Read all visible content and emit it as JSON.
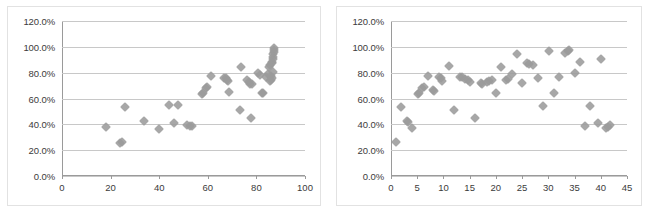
{
  "chart_data": [
    {
      "id": "left-scatter",
      "type": "scatter",
      "title": "",
      "xlabel": "",
      "ylabel": "",
      "xlim": [
        0,
        100
      ],
      "ylim": [
        0,
        1.2
      ],
      "grid": true,
      "legend": "none",
      "marker": {
        "shape": "diamond",
        "color": "#9b9b9b",
        "size": 7
      },
      "xticks": [
        0,
        20,
        40,
        60,
        80,
        100
      ],
      "xticklabels": [
        "0",
        "20",
        "40",
        "60",
        "80",
        "100"
      ],
      "yticks": [
        0,
        0.2,
        0.4,
        0.6,
        0.8,
        1.0,
        1.2
      ],
      "yticklabels": [
        "0.0%",
        "20.0%",
        "40.0%",
        "60.0%",
        "80.0%",
        "100.0%",
        "120.0%"
      ],
      "points": [
        [
          18.0,
          0.378
        ],
        [
          23.8,
          0.258
        ],
        [
          24.6,
          0.262
        ],
        [
          25.8,
          0.532
        ],
        [
          33.8,
          0.423
        ],
        [
          40.1,
          0.362
        ],
        [
          44.1,
          0.548
        ],
        [
          45.9,
          0.411
        ],
        [
          47.8,
          0.551
        ],
        [
          51.6,
          0.394
        ],
        [
          52.6,
          0.389
        ],
        [
          53.4,
          0.386
        ],
        [
          57.6,
          0.632
        ],
        [
          58.2,
          0.645
        ],
        [
          59.2,
          0.678
        ],
        [
          59.8,
          0.688
        ],
        [
          61.5,
          0.771
        ],
        [
          66.8,
          0.757
        ],
        [
          67.4,
          0.762
        ],
        [
          67.9,
          0.742
        ],
        [
          68.4,
          0.737
        ],
        [
          68.9,
          0.654
        ],
        [
          73.7,
          0.847
        ],
        [
          73.3,
          0.508
        ],
        [
          76.3,
          0.742
        ],
        [
          76.9,
          0.731
        ],
        [
          77.4,
          0.716
        ],
        [
          77.6,
          0.448
        ],
        [
          78.0,
          0.713
        ],
        [
          80.6,
          0.797
        ],
        [
          81.4,
          0.783
        ],
        [
          82.1,
          0.643
        ],
        [
          82.6,
          0.641
        ],
        [
          84.0,
          0.767
        ],
        [
          84.6,
          0.788
        ],
        [
          85.0,
          0.844
        ],
        [
          85.4,
          0.856
        ],
        [
          85.6,
          0.739
        ],
        [
          85.9,
          0.746
        ],
        [
          86.1,
          0.776
        ],
        [
          86.3,
          0.871
        ],
        [
          86.5,
          0.886
        ],
        [
          86.7,
          0.905
        ],
        [
          86.9,
          0.922
        ],
        [
          87.0,
          0.943
        ],
        [
          87.2,
          0.962
        ],
        [
          87.3,
          0.978
        ],
        [
          87.4,
          0.988
        ],
        [
          87.0,
          0.802
        ],
        [
          86.6,
          0.756
        ]
      ]
    },
    {
      "id": "right-scatter",
      "type": "scatter",
      "title": "",
      "xlabel": "",
      "ylabel": "",
      "xlim": [
        0,
        45
      ],
      "ylim": [
        0,
        1.2
      ],
      "grid": true,
      "legend": "none",
      "marker": {
        "shape": "diamond",
        "color": "#9b9b9b",
        "size": 7
      },
      "xticks": [
        0,
        5,
        10,
        15,
        20,
        25,
        30,
        35,
        40,
        45
      ],
      "xticklabels": [
        "0",
        "5",
        "10",
        "15",
        "20",
        "25",
        "30",
        "35",
        "40",
        "45"
      ],
      "yticks": [
        0,
        0.2,
        0.4,
        0.6,
        0.8,
        1.0,
        1.2
      ],
      "yticklabels": [
        "0.0%",
        "20.0%",
        "40.0%",
        "60.0%",
        "80.0%",
        "100.0%",
        "120.0%"
      ],
      "points": [
        [
          1.0,
          0.265
        ],
        [
          2.0,
          0.534
        ],
        [
          3.0,
          0.428
        ],
        [
          3.2,
          0.416
        ],
        [
          4.0,
          0.368
        ],
        [
          5.1,
          0.633
        ],
        [
          5.4,
          0.645
        ],
        [
          6.0,
          0.681
        ],
        [
          6.3,
          0.692
        ],
        [
          7.0,
          0.772
        ],
        [
          8.0,
          0.664
        ],
        [
          8.2,
          0.656
        ],
        [
          9.2,
          0.764
        ],
        [
          9.5,
          0.757
        ],
        [
          9.8,
          0.735
        ],
        [
          11.0,
          0.85
        ],
        [
          12.0,
          0.512
        ],
        [
          13.2,
          0.768
        ],
        [
          13.6,
          0.764
        ],
        [
          14.2,
          0.748
        ],
        [
          14.6,
          0.741
        ],
        [
          15.0,
          0.728
        ],
        [
          16.0,
          0.452
        ],
        [
          17.1,
          0.722
        ],
        [
          17.4,
          0.714
        ],
        [
          18.3,
          0.726
        ],
        [
          18.7,
          0.735
        ],
        [
          19.2,
          0.744
        ],
        [
          20.0,
          0.641
        ],
        [
          21.0,
          0.845
        ],
        [
          22.0,
          0.742
        ],
        [
          22.4,
          0.749
        ],
        [
          23.0,
          0.789
        ],
        [
          24.0,
          0.948
        ],
        [
          25.0,
          0.722
        ],
        [
          26.0,
          0.878
        ],
        [
          26.3,
          0.869
        ],
        [
          27.0,
          0.858
        ],
        [
          28.0,
          0.76
        ],
        [
          29.0,
          0.543
        ],
        [
          30.2,
          0.966
        ],
        [
          31.0,
          0.643
        ],
        [
          32.0,
          0.768
        ],
        [
          33.2,
          0.949
        ],
        [
          33.8,
          0.966
        ],
        [
          34.0,
          0.972
        ],
        [
          35.0,
          0.801
        ],
        [
          36.0,
          0.882
        ],
        [
          37.0,
          0.386
        ],
        [
          38.0,
          0.544
        ],
        [
          39.5,
          0.41
        ],
        [
          41.0,
          0.371
        ],
        [
          41.4,
          0.38
        ],
        [
          41.8,
          0.392
        ],
        [
          40.0,
          0.903
        ]
      ]
    }
  ]
}
